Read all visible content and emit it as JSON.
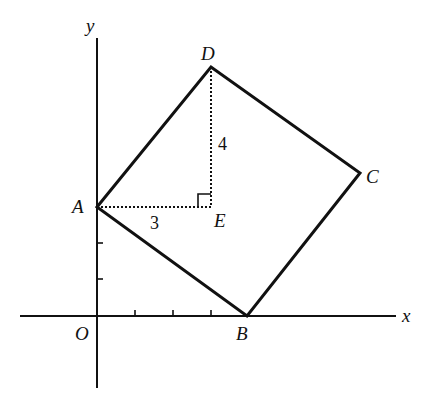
{
  "figure": {
    "type": "coordinate-geometry-diagram",
    "axes": {
      "x_label": "x",
      "y_label": "y",
      "origin_label": "O",
      "x_ticks": 3,
      "y_ticks": 2
    },
    "points": {
      "A": {
        "label": "A"
      },
      "B": {
        "label": "B"
      },
      "C": {
        "label": "C"
      },
      "D": {
        "label": "D"
      },
      "E": {
        "label": "E"
      }
    },
    "segments": {
      "AE_length": "3",
      "DE_length": "4"
    },
    "colors": {
      "stroke": "#111111",
      "background": "#ffffff"
    }
  }
}
